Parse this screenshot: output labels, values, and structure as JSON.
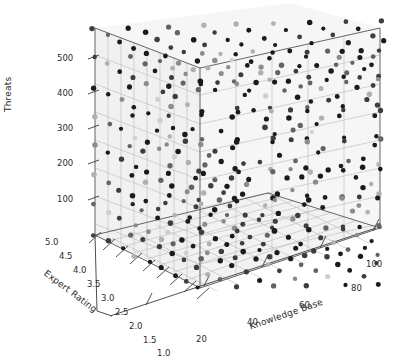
{
  "figure": {
    "kind": "3d-scatter-plot",
    "background": "#ffffff",
    "pane_color": "#efefef",
    "grid_color": "#b4b4b4",
    "axis_line_color": "#3a3a3a",
    "tick_text_color": "#2b2b2b",
    "point_colors": [
      "#1a1a1a",
      "#3d3d3d",
      "#636363",
      "#8c8c8c",
      "#b0b0b0",
      "#cfcfcf"
    ]
  },
  "axes": {
    "z": {
      "title": "Threats",
      "ticks": [
        "100",
        "200",
        "300",
        "400",
        "500"
      ],
      "values": [
        100,
        200,
        300,
        400,
        500
      ],
      "range": [
        0,
        560
      ]
    },
    "y": {
      "title": "Expert Rating",
      "ticks": [
        "5.0",
        "4.5",
        "4.0",
        "3.5",
        "3.0",
        "2.5",
        "2.0",
        "1.5",
        "1.0"
      ],
      "values": [
        5.0,
        4.5,
        4.0,
        3.5,
        3.0,
        2.5,
        2.0,
        1.5,
        1.0
      ],
      "range": [
        1.0,
        5.0
      ]
    },
    "x": {
      "title": "Knowledge Base",
      "ticks": [
        "20",
        "40",
        "60",
        "80",
        "100"
      ],
      "values": [
        20,
        40,
        60,
        80,
        100
      ],
      "range": [
        8,
        108
      ]
    }
  },
  "chart_data": {
    "type": "scatter",
    "title": "",
    "xlabel": "Knowledge Base",
    "ylabel": "Expert Rating",
    "zlabel": "Threats",
    "xlim": [
      8,
      108
    ],
    "ylim": [
      1.0,
      5.0
    ],
    "zlim": [
      0,
      560
    ],
    "grid": true,
    "legend": "none",
    "projection": "3d",
    "elev": 18,
    "azim": -56,
    "marker": "circle",
    "marker_size": 4,
    "colormap": "greys",
    "x_levels": [
      12,
      24,
      36,
      48,
      60,
      72,
      84,
      96,
      104
    ],
    "y_levels": [
      1.0,
      1.5,
      2.0,
      2.5,
      3.0,
      3.5,
      4.0,
      4.5,
      5.0
    ],
    "z_levels": [
      40,
      110,
      180,
      250,
      320,
      390,
      460,
      520
    ],
    "point_count": 648
  }
}
